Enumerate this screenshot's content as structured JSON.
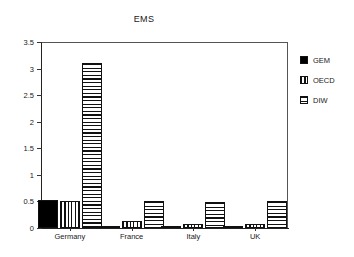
{
  "chart_data": {
    "type": "bar",
    "title": "EMS",
    "xlabel": "",
    "ylabel": "",
    "categories": [
      "Germany",
      "France",
      "Italy",
      "UK"
    ],
    "series": [
      {
        "name": "GEM",
        "pattern": "solid",
        "values": [
          0.53,
          0.04,
          0.03,
          0.03
        ]
      },
      {
        "name": "OECD",
        "pattern": "vertical",
        "values": [
          0.51,
          0.13,
          0.07,
          0.07
        ]
      },
      {
        "name": "DIW",
        "pattern": "horizontal",
        "values": [
          3.1,
          0.5,
          0.48,
          0.5
        ]
      }
    ],
    "ylim": [
      0,
      3.5
    ],
    "yticks": [
      "0",
      "0.5",
      "1",
      "1.5",
      "2",
      "2.5",
      "3",
      "3.5"
    ],
    "ytick_values": [
      0,
      0.5,
      1,
      1.5,
      2,
      2.5,
      3,
      3.5
    ],
    "grid": false,
    "legend_position": "right"
  }
}
